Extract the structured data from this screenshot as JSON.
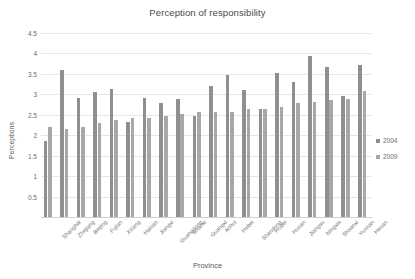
{
  "chart_data": {
    "type": "bar",
    "title": "Perception of responsibility",
    "xlabel": "Province",
    "ylabel": "Perceptions",
    "ylim": [
      0,
      4.5
    ],
    "ytick_step": 0.5,
    "yticks": [
      "0.5",
      "1",
      "1.5",
      "2",
      "2.5",
      "3",
      "3.5",
      "4",
      "4.5"
    ],
    "grid": true,
    "legend_position": "right",
    "categories": [
      "Shanghai",
      "Zhejiang",
      "Beijing",
      "Fujian",
      "Xizang",
      "Hainan",
      "Jiangxi",
      "Guangdong",
      "Shanxi",
      "Guangxi",
      "Anhui",
      "Hebei",
      "Shandong",
      "Hubei",
      "Hunan",
      "Jiangsu",
      "Ningxia",
      "Shaanxi",
      "Yunnan",
      "Henan"
    ],
    "series": [
      {
        "name": "2004",
        "color": "#8f8f8f",
        "values": [
          1.85,
          3.6,
          2.9,
          3.05,
          3.12,
          2.33,
          2.92,
          2.78,
          2.88,
          2.47,
          3.21,
          3.47,
          3.1,
          2.64,
          3.52,
          3.3,
          3.94,
          3.66,
          2.95,
          3.71
        ]
      },
      {
        "name": "2009",
        "color": "#a8a8a8",
        "values": [
          2.19,
          2.15,
          2.2,
          2.3,
          2.38,
          2.42,
          2.42,
          2.46,
          2.51,
          2.56,
          2.58,
          2.58,
          2.64,
          2.64,
          2.69,
          2.79,
          2.81,
          2.86,
          2.88,
          3.09
        ]
      }
    ]
  },
  "legend": {
    "items": [
      {
        "label": "2004"
      },
      {
        "label": "2009"
      }
    ]
  }
}
